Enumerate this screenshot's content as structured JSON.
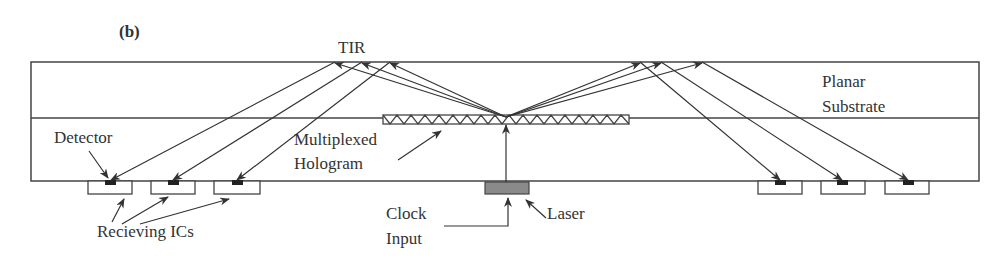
{
  "figure": {
    "panel_label": "(b)",
    "labels": {
      "tir": "TIR",
      "planar": "Planar",
      "substrate": "Substrate",
      "detector": "Detector",
      "multiplexed": "Multiplexed",
      "hologram": "Hologram",
      "receiving_ics": "Recieving ICs",
      "clock": "Clock",
      "input": "Input",
      "laser": "Laser"
    },
    "colors": {
      "line": "#333333",
      "laser_fill": "#8a8a8a",
      "detector_fill": "#222222"
    }
  }
}
